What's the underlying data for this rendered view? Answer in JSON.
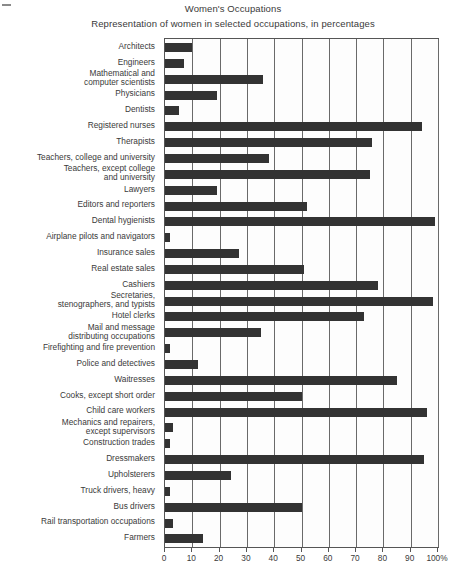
{
  "chart_data": {
    "type": "bar",
    "orientation": "horizontal",
    "title": "Women's Occupations",
    "subtitle": "Representation of women in selected occupations, in percentages",
    "xlabel": "",
    "ylabel": "",
    "xlim": [
      0,
      100
    ],
    "grid": true,
    "legend": false,
    "bar_color": "#333333",
    "xticks": [
      0,
      10,
      20,
      30,
      40,
      50,
      60,
      70,
      80,
      90,
      100
    ],
    "xtick_labels": [
      "0",
      "10",
      "20",
      "30",
      "40",
      "50",
      "60",
      "70",
      "80",
      "90",
      "100%"
    ],
    "categories": [
      "Architects",
      "Engineers",
      "Mathematical and\ncomputer scientists",
      "Physicians",
      "Dentists",
      "Registered nurses",
      "Therapists",
      "Teachers, college and university",
      "Teachers, except college\nand university",
      "Lawyers",
      "Editors and reporters",
      "Dental hygienists",
      "Airplane pilots and navigators",
      "Insurance sales",
      "Real estate sales",
      "Cashiers",
      "Secretaries,\nstenographers, and typists",
      "Hotel clerks",
      "Mail and message\ndistributing occupations",
      "Firefighting and fire prevention",
      "Police and detectives",
      "Waitresses",
      "Cooks, except short order",
      "Child care workers",
      "Mechanics and repairers,\nexcept supervisors",
      "Construction trades",
      "Dressmakers",
      "Upholsterers",
      "Truck drivers, heavy",
      "Bus drivers",
      "Rail transportation occupations",
      "Farmers"
    ],
    "values": [
      10,
      7,
      36,
      19,
      5,
      94,
      76,
      38,
      75,
      19,
      52,
      99,
      2,
      27,
      51,
      78,
      98,
      73,
      35,
      2,
      12,
      85,
      50,
      96,
      3,
      2,
      95,
      24,
      2,
      50,
      3,
      14
    ]
  }
}
